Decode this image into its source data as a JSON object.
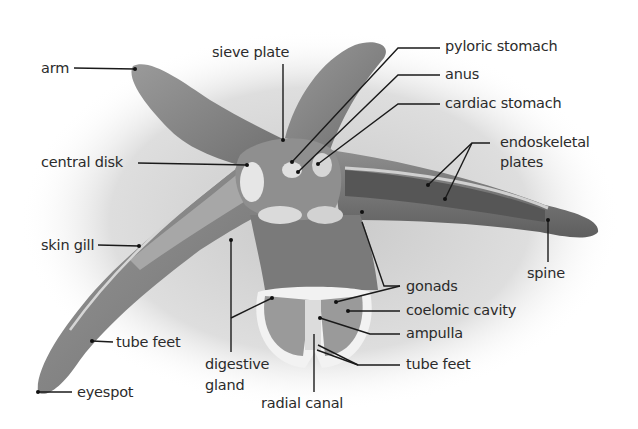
{
  "diagram": {
    "labels": {
      "arm": "arm",
      "sieve_plate": "sieve plate",
      "pyloric_stomach": "pyloric stomach",
      "anus": "anus",
      "cardiac_stomach": "cardiac stomach",
      "endoskeletal_plates_1": "endoskeletal",
      "endoskeletal_plates_2": "plates",
      "central_disk": "central disk",
      "skin_gill": "skin gill",
      "spine": "spine",
      "gonads": "gonads",
      "coelomic_cavity": "coelomic cavity",
      "ampulla": "ampulla",
      "tube_feet_left": "tube feet",
      "tube_feet_right": "tube feet",
      "digestive_gland_1": "digestive",
      "digestive_gland_2": "gland",
      "eyespot": "eyespot",
      "radial_canal": "radial canal"
    },
    "colors": {
      "label_text": "#2b2b2b",
      "leader_line": "#1a1a1a",
      "body_dark": "#6a6a6a",
      "body_mid": "#8c8c8c",
      "body_light": "#bdbdbd",
      "shadow": "#cfcfcf"
    }
  }
}
